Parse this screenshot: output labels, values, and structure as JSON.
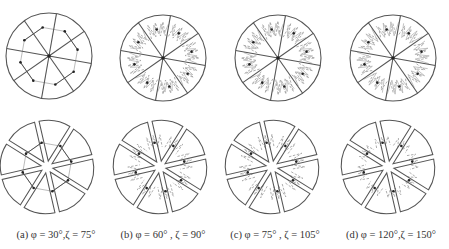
{
  "figure": {
    "panels": [
      {
        "id": "a",
        "caption": "(a) φ = 30°,ζ = 75°",
        "phi_deg": 30,
        "zeta_deg": 75,
        "top_center": [
          49,
          56
        ],
        "bottom_center": [
          47,
          167
        ],
        "caption_x": 56
      },
      {
        "id": "b",
        "caption": "(b) φ = 60° , ζ = 90°",
        "phi_deg": 60,
        "zeta_deg": 90,
        "top_center": [
          163,
          58
        ],
        "bottom_center": [
          160,
          167
        ],
        "caption_x": 163
      },
      {
        "id": "c",
        "caption": "(c) φ = 75° , ζ = 105°",
        "phi_deg": 75,
        "zeta_deg": 105,
        "top_center": [
          278,
          58
        ],
        "bottom_center": [
          272,
          167
        ],
        "caption_x": 275
      },
      {
        "id": "d",
        "caption": "(d) φ = 120°,ζ = 150°",
        "phi_deg": 120,
        "zeta_deg": 150,
        "top_center": [
          393,
          58
        ],
        "bottom_center": [
          388,
          167
        ],
        "caption_x": 391
      }
    ],
    "sector_count": 8,
    "radius": 43,
    "colors": {
      "outline": "#555555",
      "dashed": "#999999",
      "thin": "#aaaaaa",
      "dot": "#222222"
    }
  }
}
